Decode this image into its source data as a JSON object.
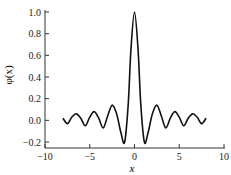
{
  "chart_data": {
    "type": "line",
    "title": "",
    "xlabel": "x",
    "ylabel": "φ(x)",
    "xlim": [
      -10,
      10
    ],
    "ylim": [
      -0.2,
      1.0
    ],
    "xticks": [
      -10,
      -5,
      0,
      5,
      10
    ],
    "xtick_labels": [
      "−10",
      "−5",
      "0",
      "5",
      "10"
    ],
    "yticks": [
      -0.2,
      0.0,
      0.2,
      0.4,
      0.6,
      0.8,
      1.0
    ],
    "ytick_labels": [
      "−0.2",
      "0.0",
      "0.2",
      "0.4",
      "0.6",
      "0.8",
      "1.0"
    ],
    "grid": false,
    "legend": null,
    "series": [
      {
        "name": "φ(x)",
        "color": "#111111",
        "x": [
          -8.0,
          -7.5,
          -7.0,
          -6.5,
          -6.0,
          -5.5,
          -5.0,
          -4.5,
          -4.0,
          -3.5,
          -3.0,
          -2.5,
          -2.0,
          -1.5,
          -1.1,
          -0.7,
          -0.4,
          0.0,
          0.4,
          0.7,
          1.1,
          1.5,
          2.0,
          2.5,
          3.0,
          3.5,
          4.0,
          4.5,
          5.0,
          5.5,
          6.0,
          6.5,
          7.0,
          7.5,
          8.0
        ],
        "y": [
          0.02,
          -0.03,
          0.03,
          0.06,
          0.02,
          -0.05,
          0.03,
          0.08,
          0.02,
          -0.07,
          0.04,
          0.14,
          0.06,
          -0.12,
          -0.2,
          0.15,
          0.65,
          1.0,
          0.65,
          0.15,
          -0.2,
          -0.12,
          0.06,
          0.14,
          0.04,
          -0.07,
          0.02,
          0.08,
          0.03,
          -0.05,
          0.02,
          0.06,
          0.03,
          -0.03,
          0.02
        ]
      }
    ]
  }
}
